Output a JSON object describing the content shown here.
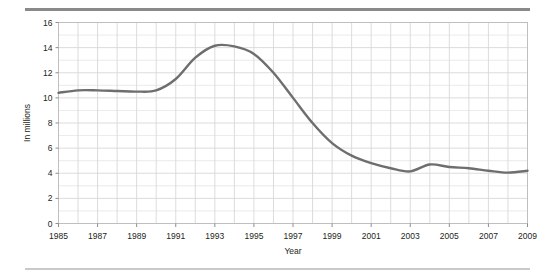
{
  "figure": {
    "top_rule_color": "#8a8a8a",
    "bottom_rule_color": "#c9c9c9",
    "background": "#ffffff"
  },
  "chart_data": {
    "type": "line",
    "title": "",
    "subtitle": "",
    "xlabel": "Year",
    "ylabel": "In millions",
    "xlim": [
      1985,
      2009
    ],
    "ylim": [
      0,
      16
    ],
    "ytick_labels": [
      "0",
      "2",
      "4",
      "6",
      "8",
      "10",
      "12",
      "14",
      "16"
    ],
    "ytick_values": [
      0,
      2,
      4,
      6,
      8,
      10,
      12,
      14,
      16
    ],
    "ytick_step": 2,
    "xtick_labels": [
      "1985",
      "1987",
      "1989",
      "1991",
      "1993",
      "1995",
      "1997",
      "1999",
      "2001",
      "2003",
      "2005",
      "2007",
      "2009"
    ],
    "xtick_values": [
      1985,
      1987,
      1989,
      1991,
      1993,
      1995,
      1997,
      1999,
      2001,
      2003,
      2005,
      2007,
      2009
    ],
    "xtick_step": 2,
    "x_minor_step": 1,
    "grid": true,
    "grid_color": "#d8d8d8",
    "plot_border_color": "#bfbfbf",
    "legend": null,
    "legend_position": "none",
    "annotations": [],
    "series": [
      {
        "name": "In millions",
        "color": "#6e6e6e",
        "line_width": 2.4,
        "x": [
          1985,
          1986,
          1987,
          1988,
          1989,
          1990,
          1991,
          1992,
          1993,
          1994,
          1995,
          1996,
          1997,
          1998,
          1999,
          2000,
          2001,
          2002,
          2003,
          2004,
          2005,
          2006,
          2007,
          2008,
          2009
        ],
        "values": [
          10.4,
          10.6,
          10.6,
          10.55,
          10.5,
          10.6,
          11.5,
          13.2,
          14.15,
          14.1,
          13.5,
          12.0,
          10.0,
          8.0,
          6.4,
          5.4,
          4.8,
          4.4,
          4.15,
          4.7,
          4.5,
          4.4,
          4.2,
          4.05,
          4.2
        ]
      }
    ]
  }
}
